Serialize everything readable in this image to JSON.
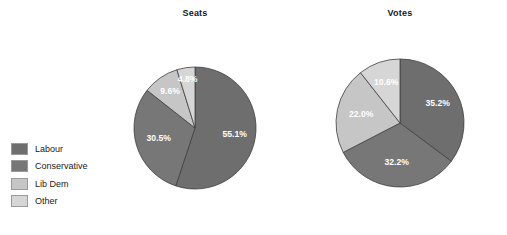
{
  "legend": {
    "position": "left",
    "items": [
      {
        "label": "Labour",
        "color": "#6e6e6e"
      },
      {
        "label": "Conservative",
        "color": "#777777"
      },
      {
        "label": "Lib Dem",
        "color": "#c6c6c6"
      },
      {
        "label": "Other",
        "color": "#d6d6d6"
      }
    ]
  },
  "charts": {
    "seats": {
      "title": "Seats",
      "labels": [
        "55.1%",
        "30.5%",
        "9.6%",
        "4.8%"
      ]
    },
    "votes": {
      "title": "Votes",
      "labels": [
        "35.2%",
        "32.2%",
        "22.0%",
        "10.6%"
      ]
    }
  },
  "chart_data": [
    {
      "type": "pie",
      "title": "Seats",
      "categories": [
        "Labour",
        "Conservative",
        "Lib Dem",
        "Other"
      ],
      "values": [
        55.1,
        30.5,
        9.6,
        4.8
      ],
      "value_labels": [
        "55.1%",
        "30.5%",
        "9.6%",
        "4.8%"
      ],
      "colors": [
        "#6e6e6e",
        "#777777",
        "#c6c6c6",
        "#d6d6d6"
      ],
      "start_angle_deg": 0,
      "direction": "clockwise",
      "units": "percent",
      "legend": "left",
      "grid": false
    },
    {
      "type": "pie",
      "title": "Votes",
      "categories": [
        "Labour",
        "Conservative",
        "Lib Dem",
        "Other"
      ],
      "values": [
        35.2,
        32.2,
        22.0,
        10.6
      ],
      "value_labels": [
        "35.2%",
        "32.2%",
        "22.0%",
        "10.6%"
      ],
      "colors": [
        "#6e6e6e",
        "#777777",
        "#c6c6c6",
        "#d6d6d6"
      ],
      "start_angle_deg": 0,
      "direction": "clockwise",
      "units": "percent",
      "legend": "left",
      "grid": false
    }
  ]
}
